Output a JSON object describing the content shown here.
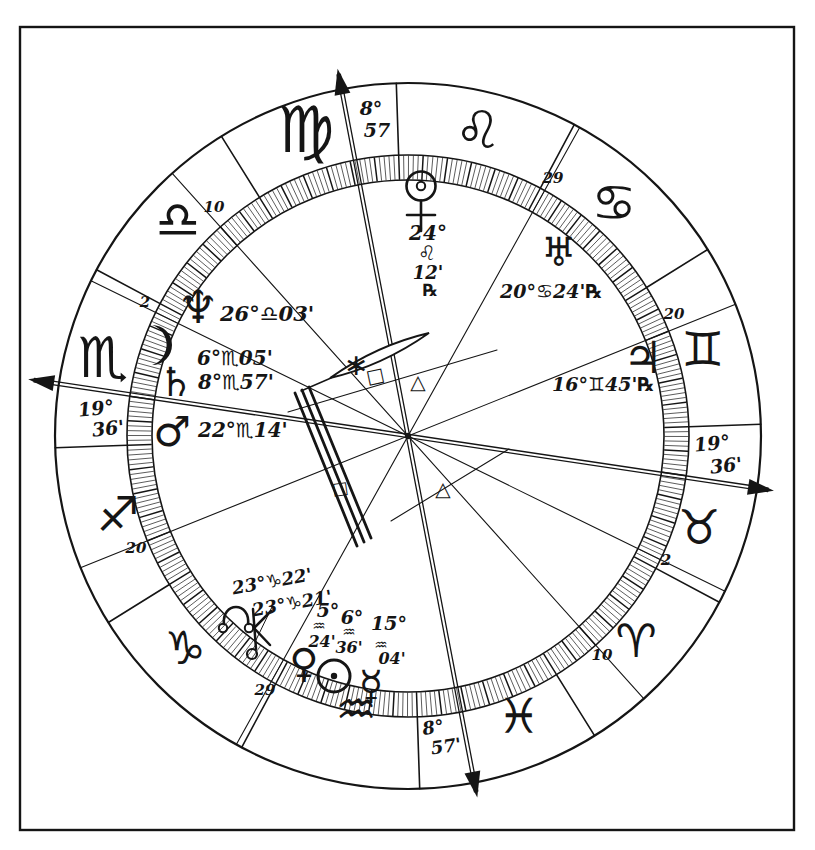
{
  "ink_color": "#151515",
  "paper_color": "#ffffff",
  "signs": [
    {
      "name": "Aries",
      "glyph": "♈"
    },
    {
      "name": "Taurus",
      "glyph": "♉"
    },
    {
      "name": "Gemini",
      "glyph": "♊"
    },
    {
      "name": "Cancer",
      "glyph": "♋"
    },
    {
      "name": "Leo",
      "glyph": "♌"
    },
    {
      "name": "Virgo",
      "glyph": "♍"
    },
    {
      "name": "Libra",
      "glyph": "♎"
    },
    {
      "name": "Scorpio",
      "glyph": "♏"
    },
    {
      "name": "Sagittarius",
      "glyph": "♐"
    },
    {
      "name": "Capricorn",
      "glyph": "♑"
    },
    {
      "name": "Aquarius",
      "glyph": "♒"
    },
    {
      "name": "Pisces",
      "glyph": "♓"
    }
  ],
  "planets": [
    {
      "name": "Pluto",
      "glyph": "♇",
      "sign": "Leo",
      "retrograde": true,
      "label_parts": [
        "24°",
        "♌",
        "12'",
        "℞"
      ]
    },
    {
      "name": "Uranus",
      "glyph": "♅",
      "sign": "Cancer",
      "retrograde": true,
      "label": "20°♋24'℞"
    },
    {
      "name": "Neptune",
      "glyph": "♆",
      "sign": "Libra",
      "label": "26°♎03'"
    },
    {
      "name": "Moon",
      "glyph": "☽",
      "sign": "Scorpio",
      "label": "6°♏05'"
    },
    {
      "name": "Saturn",
      "glyph": "♄",
      "sign": "Scorpio",
      "label": "8°♏57'"
    },
    {
      "name": "Mars",
      "glyph": "♂",
      "sign": "Scorpio",
      "label": "22°♏14'"
    },
    {
      "name": "Jupiter",
      "glyph": "♃",
      "sign": "Gemini",
      "retrograde": true,
      "label": "16°♊45'℞"
    },
    {
      "name": "North Node",
      "glyph": "☊",
      "sign": "Capricorn",
      "label": "23°♑22'"
    },
    {
      "name": "Chiron",
      "glyph": "⚷",
      "sign": "Capricorn",
      "label": "23°♑21'"
    },
    {
      "name": "Venus",
      "glyph": "♀",
      "sign": "Aquarius",
      "label_parts": [
        "5°",
        "♒",
        "24'"
      ]
    },
    {
      "name": "Sun",
      "glyph": "☉",
      "sign": "Aquarius",
      "label_parts": [
        "6°",
        "♒",
        "36'"
      ]
    },
    {
      "name": "Mercury",
      "glyph": "☿",
      "sign": "Aquarius",
      "label_parts": [
        "15°",
        "♒",
        "04'"
      ]
    }
  ],
  "angles": {
    "ascendant": {
      "deg": "19°",
      "min": "36'"
    },
    "descendant": {
      "deg": "19°",
      "min": "36'"
    },
    "midheaven": {
      "deg": "8°",
      "min": "57"
    },
    "imum_coeli": {
      "deg": "8°",
      "min": "57'"
    }
  },
  "house_cusp_degrees": [
    "10",
    "2",
    "20",
    "29",
    "29",
    "20",
    "2",
    "10"
  ],
  "aspect_marks": [
    {
      "name": "sextile",
      "glyph": "∗"
    },
    {
      "name": "square",
      "glyph": "□"
    },
    {
      "name": "trine",
      "glyph": "△"
    },
    {
      "name": "square",
      "glyph": "□"
    },
    {
      "name": "trine",
      "glyph": "△"
    }
  ]
}
